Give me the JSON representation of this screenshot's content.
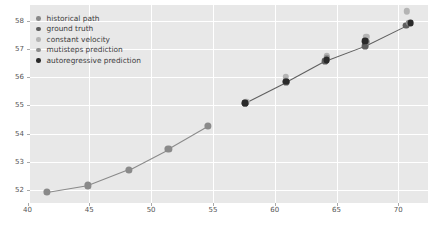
{
  "chart_data": {
    "type": "scatter",
    "title": "",
    "xlabel": "",
    "ylabel": "",
    "xlim": [
      40.2,
      72.4
    ],
    "ylim": [
      51.55,
      58.55
    ],
    "xticks": [
      40,
      45,
      50,
      55,
      60,
      65,
      70
    ],
    "yticks": [
      52,
      53,
      54,
      55,
      56,
      57,
      58
    ],
    "grid": true,
    "legend_position": "upper left",
    "background": "#e8e8e8",
    "gridline_color": "#ffffff",
    "series": [
      {
        "name": "historical path",
        "color": "#8a8a8a",
        "marker_size": 3.6,
        "line": true,
        "points": [
          {
            "x": 41.6,
            "y": 51.93
          },
          {
            "x": 44.9,
            "y": 52.17
          },
          {
            "x": 48.2,
            "y": 52.73
          },
          {
            "x": 51.4,
            "y": 53.46
          },
          {
            "x": 54.6,
            "y": 54.27
          }
        ]
      },
      {
        "name": "ground truth",
        "color": "#5e5e5e",
        "marker_size": 3.4,
        "line": true,
        "points": [
          {
            "x": 57.6,
            "y": 55.09
          },
          {
            "x": 60.9,
            "y": 55.82
          },
          {
            "x": 64.1,
            "y": 56.58
          },
          {
            "x": 67.3,
            "y": 57.11
          },
          {
            "x": 70.6,
            "y": 57.82
          }
        ]
      },
      {
        "name": "constant velocity",
        "color": "#b4b4b4",
        "marker_size": 3.2,
        "line": false,
        "points": [
          {
            "x": 57.7,
            "y": 55.12
          },
          {
            "x": 60.9,
            "y": 56.02
          },
          {
            "x": 64.2,
            "y": 56.74
          },
          {
            "x": 67.4,
            "y": 57.43
          },
          {
            "x": 70.7,
            "y": 58.33
          }
        ]
      },
      {
        "name": "mutisteps prediction",
        "color": "#8f8f8f",
        "marker_size": 3.2,
        "line": false,
        "points": [
          {
            "x": 57.6,
            "y": 55.09
          },
          {
            "x": 60.9,
            "y": 55.88
          },
          {
            "x": 64.2,
            "y": 56.66
          },
          {
            "x": 67.4,
            "y": 57.24
          },
          {
            "x": 70.9,
            "y": 57.92
          }
        ]
      },
      {
        "name": "autoregressive prediction",
        "color": "#2a2a2a",
        "marker_size": 3.4,
        "line": false,
        "points": [
          {
            "x": 57.6,
            "y": 55.07
          },
          {
            "x": 60.9,
            "y": 55.84
          },
          {
            "x": 64.2,
            "y": 56.6
          },
          {
            "x": 67.3,
            "y": 57.28
          },
          {
            "x": 71.0,
            "y": 57.9
          }
        ]
      }
    ]
  },
  "legend": {
    "items": [
      {
        "label": "historical path",
        "color": "#8a8a8a"
      },
      {
        "label": "ground truth",
        "color": "#5e5e5e"
      },
      {
        "label": "constant velocity",
        "color": "#b4b4b4"
      },
      {
        "label": "mutisteps prediction",
        "color": "#8f8f8f"
      },
      {
        "label": "autoregressive prediction",
        "color": "#2a2a2a"
      }
    ]
  },
  "caption": {
    "text": ""
  }
}
